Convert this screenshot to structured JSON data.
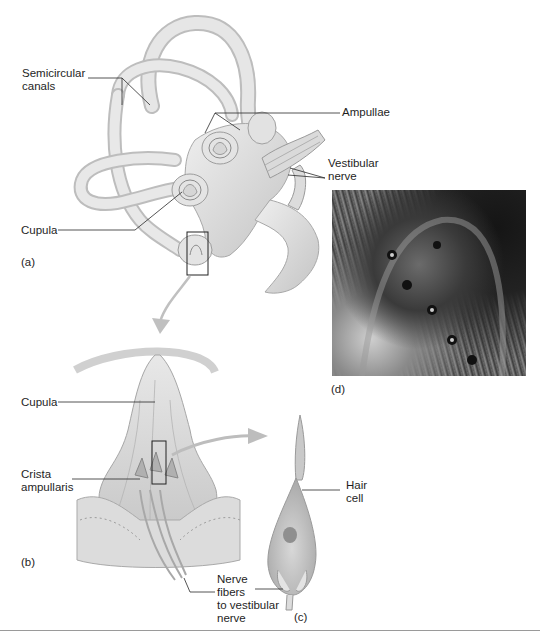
{
  "figure": {
    "panels": {
      "a": {
        "letter": "(a)",
        "labels": {
          "semicircular_canals": "Semicircular\ncanals",
          "ampullae": "Ampullae",
          "vestibular_nerve": "Vestibular\nnerve",
          "cupula": "Cupula"
        }
      },
      "b": {
        "letter": "(b)",
        "labels": {
          "cupula": "Cupula",
          "crista_ampullaris": "Crista\nampullaris",
          "nerve_fibers": "Nerve\nfibers\nto vestibular\nnerve"
        }
      },
      "c": {
        "letter": "(c)",
        "labels": {
          "hair_cell": "Hair\ncell"
        }
      },
      "d": {
        "letter": "(d)",
        "image": "scanning-electron-micrograph"
      }
    },
    "colors": {
      "tissue_light": "#e2e2e2",
      "tissue_mid": "#c8c8c8",
      "tissue_dark": "#9e9e9e",
      "leader_line": "#2a2a2a",
      "arrow": "#b9b9b9",
      "rule": "#9a9a9a"
    }
  }
}
